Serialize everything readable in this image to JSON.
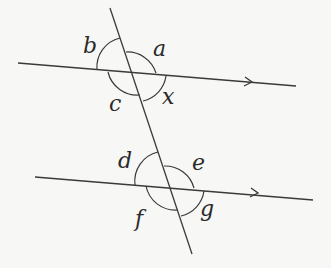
{
  "diagram": {
    "upper_intersection_labels": {
      "top_left": "b",
      "top_right": "a",
      "bottom_left": "c",
      "bottom_right": "x"
    },
    "lower_intersection_labels": {
      "top_left": "d",
      "top_right": "e",
      "bottom_left": "f",
      "bottom_right": "g"
    },
    "colors": {
      "line": "#3a3a3a",
      "background": "#f7f7f5"
    }
  }
}
